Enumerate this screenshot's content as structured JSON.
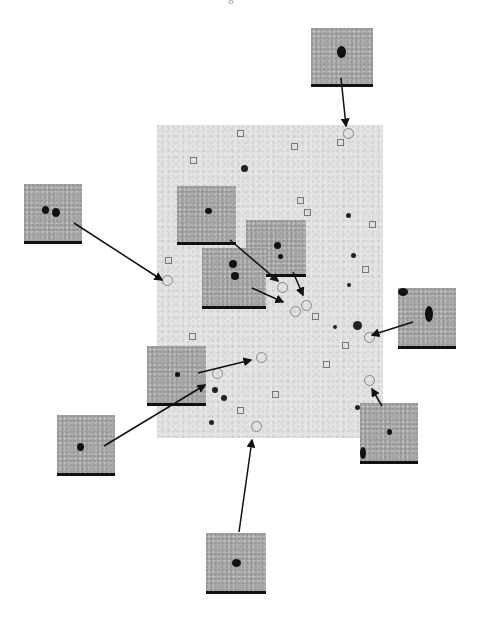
{
  "page": {
    "number_fragment": "8"
  },
  "figure": {
    "field": {
      "x": 157,
      "y": 125,
      "width": 226,
      "height": 313
    },
    "thumbnails": [
      {
        "id": "top",
        "x": 311,
        "y": 28,
        "w": 62,
        "h": 56
      },
      {
        "id": "left-upper",
        "x": 24,
        "y": 184,
        "w": 58,
        "h": 57
      },
      {
        "id": "inner-1",
        "x": 177,
        "y": 186,
        "w": 59,
        "h": 56
      },
      {
        "id": "inner-2",
        "x": 246,
        "y": 220,
        "w": 60,
        "h": 54
      },
      {
        "id": "inner-3",
        "x": 202,
        "y": 248,
        "w": 64,
        "h": 58
      },
      {
        "id": "right-upper",
        "x": 398,
        "y": 288,
        "w": 58,
        "h": 58
      },
      {
        "id": "left-middle",
        "x": 147,
        "y": 346,
        "w": 59,
        "h": 57
      },
      {
        "id": "right-lower",
        "x": 360,
        "y": 403,
        "w": 58,
        "h": 58
      },
      {
        "id": "left-lower",
        "x": 57,
        "y": 415,
        "w": 58,
        "h": 58
      },
      {
        "id": "bottom",
        "x": 206,
        "y": 533,
        "w": 60,
        "h": 58
      }
    ]
  }
}
